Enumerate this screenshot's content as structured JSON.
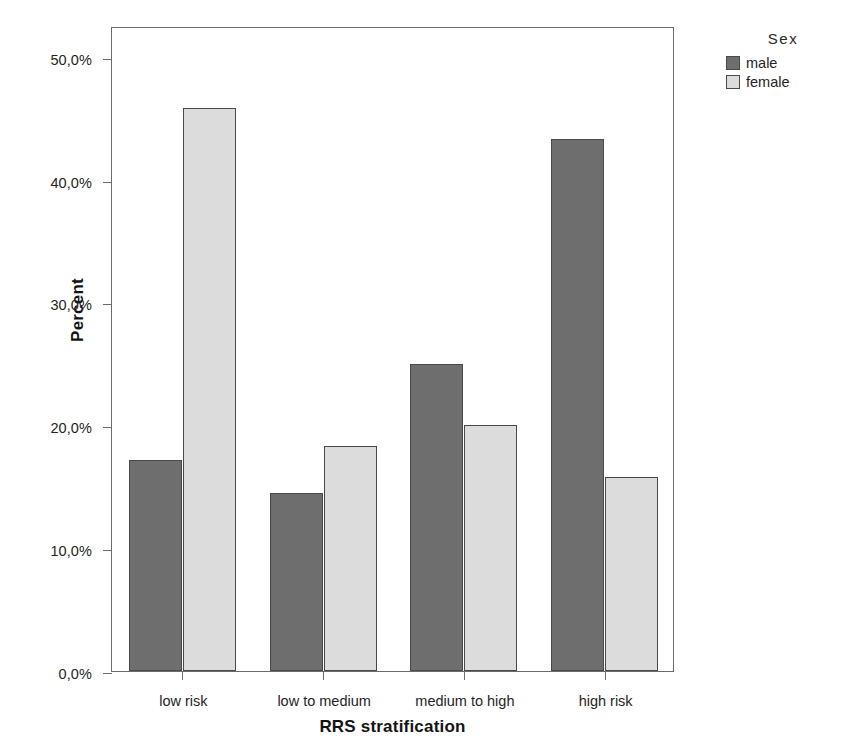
{
  "chart_data": {
    "type": "bar",
    "title": "",
    "xlabel": "RRS stratification",
    "ylabel": "Percent",
    "categories": [
      "low risk",
      "low to medium",
      "medium to high",
      "high risk"
    ],
    "series": [
      {
        "name": "male",
        "color": "#6e6e6e",
        "values": [
          17.2,
          14.5,
          25.0,
          43.3
        ]
      },
      {
        "name": "female",
        "color": "#dcdcdc",
        "values": [
          45.8,
          18.3,
          20.0,
          15.8
        ]
      }
    ],
    "ylim": [
      0,
      52.5
    ],
    "yticks": [
      0,
      10,
      20,
      30,
      40,
      50
    ],
    "ytick_labels": [
      "0,0%",
      "10,0%",
      "20,0%",
      "30,0%",
      "40,0%",
      "50,0%"
    ],
    "grid": false,
    "legend_position": "top-right",
    "legend_title": "Sex",
    "value_suffix": "%",
    "decimal_separator": ","
  },
  "axes": {
    "y_title": "Percent",
    "x_title": "RRS stratification"
  },
  "legend": {
    "title": "Sex",
    "items": [
      {
        "label": "male",
        "swatch": "male-swatch"
      },
      {
        "label": "female",
        "swatch": "female-swatch"
      }
    ]
  },
  "colors": {
    "male": "#6e6e6e",
    "female": "#dcdcdc",
    "bar_border": "#4a4a4a",
    "frame": "#6b6b6b",
    "text": "#252525",
    "background": "#ffffff"
  }
}
